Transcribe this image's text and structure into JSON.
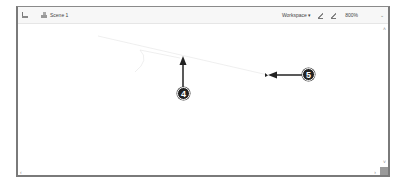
{
  "toolbar": {
    "scene_tab_label": "Scene 1",
    "workspace_label": "Workspace ▾",
    "zoom_level": "800%",
    "zoom_dropdown": "⌄"
  },
  "scrollbars": {
    "up": "˄",
    "down": "˅",
    "left": "‹",
    "right": "›"
  },
  "callouts": [
    {
      "number": "4"
    },
    {
      "number": "5"
    }
  ],
  "colors": {
    "callout_bg": "#222222",
    "arrow": "#222222",
    "border": "#7a7a7a"
  }
}
